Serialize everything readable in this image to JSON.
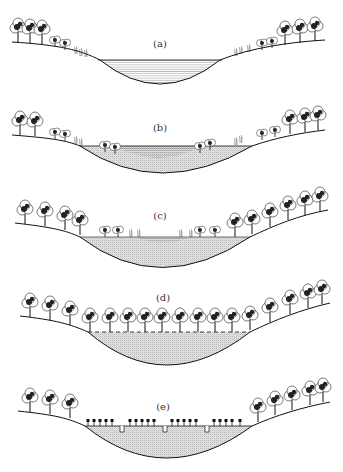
{
  "diagram": {
    "type": "succession-cross-sections",
    "panels": [
      {
        "id": "a",
        "label": "(a)",
        "fill": "open-water",
        "description": "Open water basin with marginal reeds and trees on slopes"
      },
      {
        "id": "b",
        "label": "(b)",
        "fill": "water-and-sediment",
        "description": "Sediment accumulating, shrubs encroaching at edges"
      },
      {
        "id": "c",
        "label": "(c)",
        "fill": "sediment",
        "description": "Small central pool, shrubs spreading across basin"
      },
      {
        "id": "d",
        "label": "(d)",
        "fill": "sediment",
        "description": "Basin filled, trees across surface, dashed former water line"
      },
      {
        "id": "e",
        "label": "(e)",
        "fill": "sediment",
        "description": "Drained basin with cultivated plants and drainage ditches"
      }
    ]
  },
  "colors": {
    "ink": "#1a1a1a",
    "stipple": "#9a9a9a",
    "water": "#8a8a8a",
    "background": "#ffffff"
  }
}
